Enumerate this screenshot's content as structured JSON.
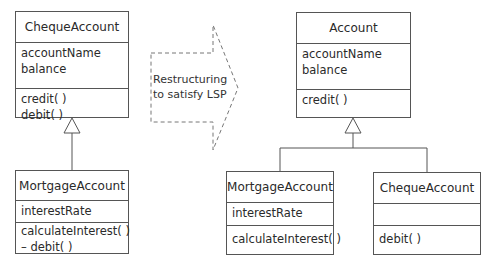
{
  "left": {
    "superclass": {
      "name": "ChequeAccount",
      "attributes": [
        "accountName",
        "balance"
      ],
      "operations": [
        "credit( )",
        "debit( )"
      ]
    },
    "subclass": {
      "name": "MortgageAccount",
      "attributes": [
        "interestRate"
      ],
      "operations": [
        "calculateInterest( )",
        "– debit( )"
      ]
    }
  },
  "transition": {
    "label_line1": "Restructuring",
    "label_line2": "to satisfy LSP"
  },
  "right": {
    "superclass": {
      "name": "Account",
      "attributes": [
        "accountName",
        "balance"
      ],
      "operations": [
        "credit( )"
      ]
    },
    "subclass_1": {
      "name": "MortgageAccount",
      "attributes": [
        "interestRate"
      ],
      "operations": [
        "calculateInterest( )"
      ]
    },
    "subclass_2": {
      "name": "ChequeAccount",
      "attributes": [],
      "operations": [
        "debit( )"
      ]
    }
  }
}
